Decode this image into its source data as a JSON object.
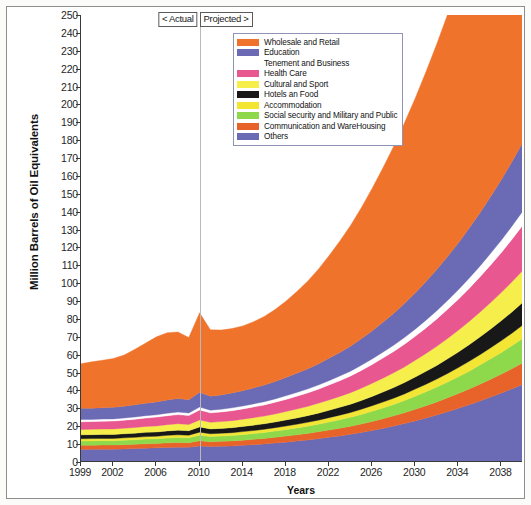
{
  "chart_data": {
    "type": "area",
    "stacked": true,
    "title": "",
    "xlabel": "Years",
    "ylabel": "Million Barrels of Oil Equivalents",
    "ylim": [
      0,
      250
    ],
    "ytick_step": 10,
    "xlim": [
      1999,
      2040
    ],
    "grid": false,
    "legend_position": "top-right-inside",
    "x": [
      1999,
      2000,
      2001,
      2002,
      2003,
      2004,
      2005,
      2006,
      2007,
      2008,
      2009,
      2010,
      2011,
      2012,
      2013,
      2014,
      2015,
      2016,
      2017,
      2018,
      2019,
      2020,
      2021,
      2022,
      2023,
      2024,
      2025,
      2026,
      2027,
      2028,
      2029,
      2030,
      2031,
      2032,
      2033,
      2034,
      2035,
      2036,
      2037,
      2038,
      2039,
      2040
    ],
    "yticks": [
      0,
      10,
      20,
      30,
      40,
      50,
      60,
      70,
      80,
      90,
      100,
      110,
      120,
      130,
      140,
      150,
      160,
      170,
      180,
      190,
      200,
      210,
      220,
      230,
      240,
      250
    ],
    "xticks": [
      1999,
      2002,
      2006,
      2010,
      2014,
      2018,
      2022,
      2026,
      2030,
      2034,
      2038
    ],
    "annotations": [
      {
        "text": "< Actual",
        "at_x": 2010,
        "side": "left"
      },
      {
        "text": "Projected >",
        "at_x": 2010,
        "side": "right"
      }
    ],
    "divider_x": 2010,
    "series": [
      {
        "name": "Others",
        "color": "#6a6ab5",
        "values": [
          7.0,
          7.1,
          7.2,
          7.2,
          7.3,
          7.5,
          7.7,
          7.9,
          8.1,
          8.3,
          8.2,
          9.0,
          8.6,
          8.8,
          9.0,
          9.3,
          9.7,
          10.1,
          10.6,
          11.1,
          11.7,
          12.3,
          13.0,
          13.8,
          14.6,
          15.5,
          16.5,
          17.6,
          18.8,
          20.1,
          21.5,
          23.0,
          24.6,
          26.3,
          28.1,
          30.0,
          32.0,
          34.1,
          36.3,
          38.6,
          41.0,
          43.5
        ]
      },
      {
        "name": "Communication and WareHousing",
        "color": "#e8632a",
        "values": [
          2.3,
          2.3,
          2.3,
          2.3,
          2.4,
          2.4,
          2.5,
          2.5,
          2.6,
          2.6,
          2.6,
          2.9,
          2.7,
          2.8,
          2.8,
          2.9,
          3.0,
          3.1,
          3.2,
          3.4,
          3.5,
          3.7,
          3.9,
          4.1,
          4.3,
          4.5,
          4.8,
          5.1,
          5.4,
          5.7,
          6.1,
          6.5,
          6.9,
          7.3,
          7.8,
          8.3,
          8.8,
          9.4,
          10.0,
          10.6,
          11.3,
          12.0
        ]
      },
      {
        "name": "Social security and Military and Public",
        "color": "#8ed84c",
        "values": [
          2.4,
          2.4,
          2.4,
          2.4,
          2.5,
          2.5,
          2.6,
          2.6,
          2.7,
          2.8,
          2.7,
          3.1,
          2.9,
          2.9,
          3.0,
          3.1,
          3.2,
          3.3,
          3.5,
          3.6,
          3.8,
          4.0,
          4.2,
          4.5,
          4.7,
          5.0,
          5.3,
          5.7,
          6.0,
          6.4,
          6.8,
          7.3,
          7.8,
          8.3,
          8.8,
          9.4,
          10.0,
          10.7,
          11.4,
          12.1,
          12.9,
          13.7
        ]
      },
      {
        "name": "Accommodation",
        "color": "#f2e534",
        "values": [
          1.3,
          1.3,
          1.3,
          1.3,
          1.3,
          1.4,
          1.4,
          1.4,
          1.5,
          1.5,
          1.5,
          1.7,
          1.6,
          1.6,
          1.6,
          1.7,
          1.7,
          1.8,
          1.9,
          2.0,
          2.1,
          2.2,
          2.3,
          2.4,
          2.6,
          2.7,
          2.9,
          3.1,
          3.3,
          3.5,
          3.7,
          4.0,
          4.2,
          4.5,
          4.8,
          5.1,
          5.5,
          5.8,
          6.2,
          6.6,
          7.0,
          7.5
        ]
      },
      {
        "name": "Hotels an Food",
        "color": "#181818",
        "values": [
          2.2,
          2.2,
          2.2,
          2.2,
          2.3,
          2.3,
          2.4,
          2.4,
          2.5,
          2.6,
          2.5,
          2.9,
          2.7,
          2.7,
          2.8,
          2.9,
          3.0,
          3.1,
          3.2,
          3.4,
          3.5,
          3.7,
          3.9,
          4.1,
          4.4,
          4.6,
          4.9,
          5.2,
          5.6,
          5.9,
          6.3,
          6.7,
          7.2,
          7.6,
          8.2,
          8.7,
          9.3,
          9.9,
          10.5,
          11.2,
          11.9,
          12.7
        ]
      },
      {
        "name": "Cultural and Sport",
        "color": "#f6ef4b",
        "values": [
          3.0,
          3.0,
          3.0,
          3.1,
          3.1,
          3.2,
          3.3,
          3.4,
          3.5,
          3.6,
          3.5,
          3.9,
          3.7,
          3.8,
          3.9,
          4.0,
          4.2,
          4.3,
          4.5,
          4.7,
          5.0,
          5.2,
          5.5,
          5.8,
          6.1,
          6.5,
          6.9,
          7.3,
          7.8,
          8.3,
          8.8,
          9.4,
          10.0,
          10.7,
          11.4,
          12.2,
          13.0,
          13.9,
          14.8,
          15.8,
          16.8,
          17.9
        ]
      },
      {
        "name": "Health Care",
        "color": "#e8578f",
        "values": [
          4.3,
          4.3,
          4.4,
          4.4,
          4.5,
          4.6,
          4.7,
          4.9,
          5.0,
          5.1,
          5.0,
          5.6,
          5.3,
          5.4,
          5.6,
          5.8,
          6.0,
          6.2,
          6.5,
          6.8,
          7.2,
          7.5,
          7.9,
          8.4,
          8.8,
          9.3,
          9.9,
          10.5,
          11.2,
          11.9,
          12.6,
          13.4,
          14.3,
          15.3,
          16.3,
          17.3,
          18.5,
          19.7,
          21.0,
          22.3,
          23.8,
          25.3
        ]
      },
      {
        "name": "Tenement and Business",
        "color": "#ffffff",
        "values": [
          1.2,
          1.2,
          1.2,
          1.2,
          1.2,
          1.3,
          1.3,
          1.3,
          1.4,
          1.4,
          1.4,
          1.6,
          1.5,
          1.5,
          1.6,
          1.6,
          1.7,
          1.8,
          1.9,
          2.0,
          2.1,
          2.2,
          2.3,
          2.4,
          2.6,
          2.7,
          2.9,
          3.1,
          3.3,
          3.5,
          3.8,
          4.0,
          4.3,
          4.6,
          4.9,
          5.3,
          5.6,
          6.0,
          6.5,
          6.9,
          7.4,
          7.9
        ]
      },
      {
        "name": "Education",
        "color": "#6a6ab5",
        "values": [
          6.3,
          6.3,
          6.4,
          6.5,
          6.6,
          6.8,
          7.0,
          7.2,
          7.4,
          7.6,
          7.4,
          8.3,
          7.8,
          8.0,
          8.3,
          8.6,
          8.9,
          9.3,
          9.7,
          10.2,
          10.7,
          11.2,
          11.8,
          12.5,
          13.2,
          14.0,
          14.8,
          15.7,
          16.7,
          17.8,
          19.0,
          20.2,
          21.6,
          23.0,
          24.6,
          26.2,
          28.0,
          29.8,
          31.8,
          33.9,
          36.1,
          38.5
        ]
      },
      {
        "name": "Wholesale and Retail",
        "color": "#f0732c",
        "values": [
          25.0,
          25.9,
          26.5,
          27.3,
          28.6,
          31.0,
          33.6,
          36.4,
          37.6,
          37.2,
          34.8,
          44.5,
          37.2,
          36.3,
          36.0,
          36.2,
          37.0,
          38.4,
          40.3,
          42.7,
          45.6,
          49.0,
          52.9,
          57.3,
          62.2,
          67.5,
          73.3,
          79.6,
          86.3,
          93.4,
          101.0,
          109.0,
          117.4,
          126.2,
          135.4,
          145.0,
          155.0,
          165.4,
          176.2,
          187.4,
          199.0,
          211.0
        ]
      }
    ]
  },
  "legend": {
    "items": [
      {
        "label": "Wholesale and Retail",
        "color": "#f0732c"
      },
      {
        "label": "Education",
        "color": "#6a6ab5"
      },
      {
        "label": "Tenement and Business",
        "color": "#ffffff"
      },
      {
        "label": "Health Care",
        "color": "#e8578f"
      },
      {
        "label": "Cultural and Sport",
        "color": "#f6ef4b"
      },
      {
        "label": "Hotels an Food",
        "color": "#181818"
      },
      {
        "label": "Accommodation",
        "color": "#f2e534"
      },
      {
        "label": "Social security and Military and Public",
        "color": "#8ed84c"
      },
      {
        "label": "Communication and WareHousing",
        "color": "#e8632a"
      },
      {
        "label": "Others",
        "color": "#6a6ab5"
      }
    ]
  },
  "axes": {
    "y_title": "Million Barrels of Oil Equivalents",
    "x_title": "Years"
  },
  "phase_labels": {
    "actual": "< Actual",
    "projected": "Projected >"
  }
}
